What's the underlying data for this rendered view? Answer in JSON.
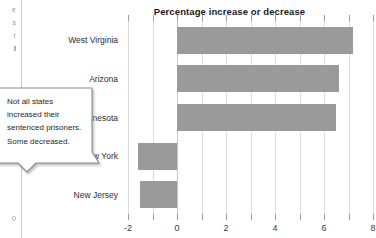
{
  "document": {
    "bleed_text": [
      "e",
      "s",
      "r",
      "l",
      "0"
    ]
  },
  "callout": {
    "text": "Not all states increased their sentenced prisoners. Some decreased.",
    "border_color": "#8c8c8c",
    "fill_color": "#ffffff"
  },
  "chart_data": {
    "type": "bar",
    "orientation": "horizontal",
    "title": "Percentage increase or decrease",
    "xlabel": "",
    "ylabel": "",
    "categories": [
      "West Virginia",
      "Arizona",
      "Minnesota",
      "New York",
      "New Jersey"
    ],
    "values": [
      7.2,
      6.6,
      6.5,
      -1.6,
      -1.5
    ],
    "xlim": [
      -2,
      8
    ],
    "xticks": [
      -2,
      0,
      2,
      4,
      6,
      8
    ],
    "xtick_labels": [
      "-2",
      "0",
      "2",
      "4",
      "6",
      "8"
    ],
    "minor_xticks": [
      -1,
      1,
      3,
      5,
      7
    ],
    "grid": true,
    "bar_color": "#9a9a9a",
    "zero_line": 0,
    "legend": null
  }
}
